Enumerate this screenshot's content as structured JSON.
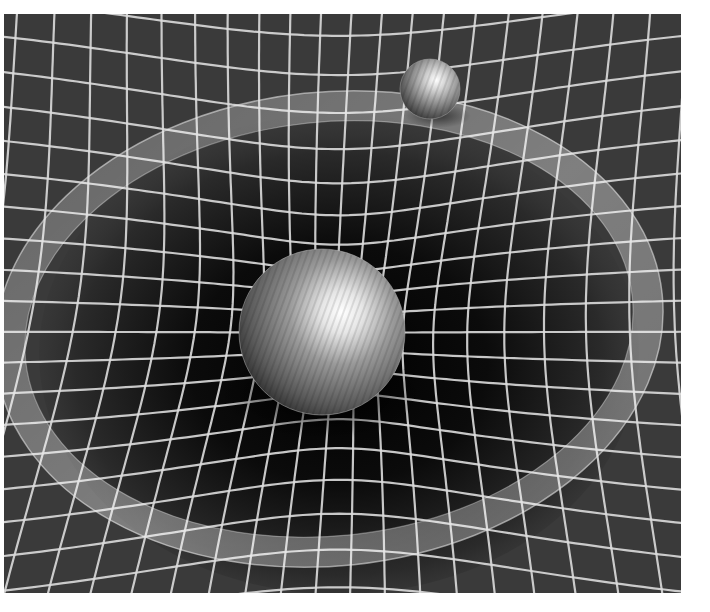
{
  "image": {
    "subject": "Spacetime curvature illustration: a large sphere sits in a gravity well on a warped grid, with a small sphere orbiting along a translucent ring",
    "frame": {
      "x": 4,
      "y": 14,
      "width": 677,
      "height": 579
    },
    "colors": {
      "page_background": "#ffffff",
      "grid_background": "#3a3a3a",
      "well_shadow": "#050505",
      "grid_line": "#dcdcdc",
      "orbit_ring": "#e8e8e8",
      "sphere_base": "#5a5a5a",
      "sphere_highlight": "#ffffff"
    },
    "grid": {
      "cell_size": 34,
      "line_width": 2.2,
      "well_center": [
        335,
        330
      ],
      "well_radius": 330,
      "well_depth": 0.55
    },
    "orbit_ring": {
      "center": [
        325,
        315
      ],
      "rx": 320,
      "ry": 222,
      "rotation_deg": -6,
      "band_width": 30
    },
    "large_sphere": {
      "cx": 318,
      "cy": 318,
      "r": 83,
      "label": "massive body"
    },
    "small_sphere": {
      "cx": 426,
      "cy": 75,
      "r": 30,
      "label": "orbiting body"
    }
  }
}
